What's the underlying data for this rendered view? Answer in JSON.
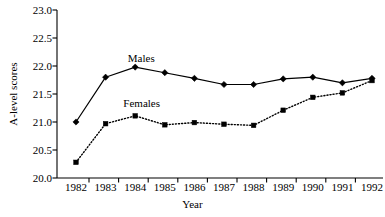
{
  "chart_data": {
    "type": "line",
    "title": "",
    "xlabel": "Year",
    "ylabel": "A-level scores",
    "categories": [
      "1982",
      "1983",
      "1984",
      "1985",
      "1986",
      "1987",
      "1988",
      "1989",
      "1990",
      "1991",
      "1992"
    ],
    "x": [
      1982,
      1983,
      1984,
      1985,
      1986,
      1987,
      1988,
      1989,
      1990,
      1991,
      1992
    ],
    "ylim": [
      20.0,
      23.0
    ],
    "ytick_labels": [
      "20.0",
      "20.5",
      "21.0",
      "21.5",
      "22.0",
      "22.5",
      "23.0"
    ],
    "ytick_values": [
      20.0,
      20.5,
      21.0,
      21.5,
      22.0,
      22.5,
      23.0
    ],
    "grid": false,
    "legend_position": "inline-annotations",
    "series": [
      {
        "name": "Males",
        "marker": "diamond",
        "linestyle": "solid",
        "color": "#000000",
        "values": [
          21.0,
          21.8,
          21.98,
          21.88,
          21.78,
          21.67,
          21.67,
          21.77,
          21.8,
          21.7,
          21.78
        ]
      },
      {
        "name": "Females",
        "marker": "square",
        "linestyle": "dotted",
        "color": "#000000",
        "values": [
          20.28,
          20.97,
          21.11,
          20.95,
          20.99,
          20.96,
          20.94,
          21.21,
          21.44,
          21.52,
          21.74
        ]
      }
    ],
    "annotations": [
      {
        "text": "Males",
        "x": 1983.75,
        "y": 22.13
      },
      {
        "text": "Females",
        "x": 1983.6,
        "y": 21.32
      }
    ]
  },
  "axes": {
    "y_title": "A-level scores",
    "x_title": "Year"
  }
}
